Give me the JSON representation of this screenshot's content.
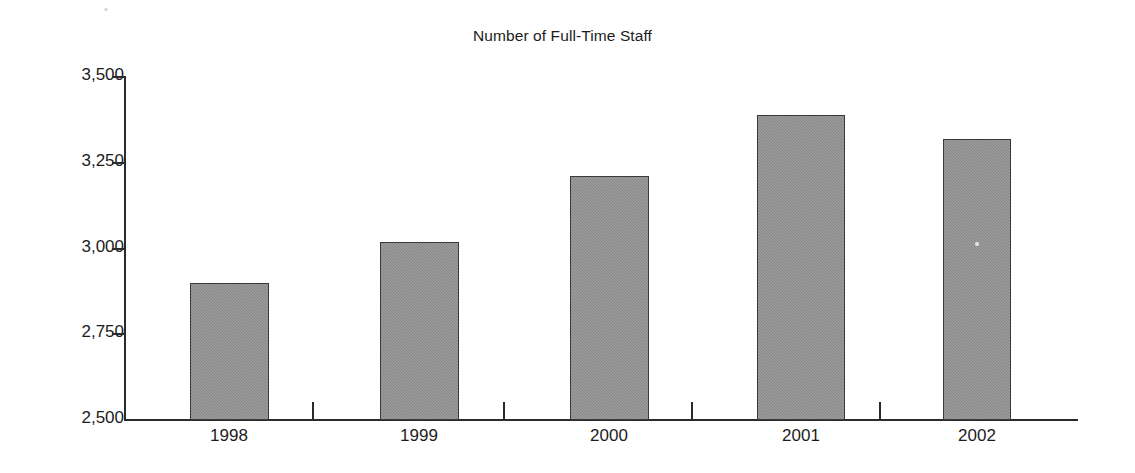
{
  "chart_data": {
    "type": "bar",
    "title": "Number of Full-Time Staff",
    "xlabel": "",
    "ylabel": "",
    "categories": [
      "1998",
      "1999",
      "2000",
      "2001",
      "2002"
    ],
    "values": [
      2900,
      3020,
      3210,
      3390,
      3320
    ],
    "series": [
      {
        "name": "Number of Full-Time Staff",
        "values": [
          2900,
          3020,
          3210,
          3390,
          3320
        ]
      }
    ],
    "ylim": [
      2500,
      3500
    ],
    "ytick_labels": [
      "3,500",
      "3,250",
      "3,000",
      "2,750",
      "2,500"
    ],
    "ytick_values": [
      3500,
      3250,
      3000,
      2750,
      2500
    ],
    "grid": false,
    "legend": false,
    "bar_color": "#8d8d8d",
    "bar_edge_color": "#3a3a3a",
    "axis_color": "#2b2b2b",
    "background_color": "#ffffff",
    "text_color": "#1c1c1c"
  }
}
